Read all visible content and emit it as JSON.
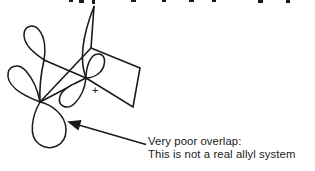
{
  "canvas": {
    "bg": "#ffffff",
    "ink": "#1a1a1a"
  },
  "figure": {
    "type": "orbital-overlap-diagram",
    "parts": [
      "bicyclic-carbon-skeleton",
      "alkene-upper-p-lobe",
      "left-carbon-upper-p-lobe",
      "left-carbon-lower-p-lobe",
      "cation-carbon-upper-p-lobe",
      "cation-carbon-lower-p-lobe",
      "annotation-arrow"
    ]
  },
  "molecule": {
    "charge_symbol": "+"
  },
  "annotation": {
    "line1": "Very poor overlap:",
    "line2": "This is not a real allyl system"
  }
}
